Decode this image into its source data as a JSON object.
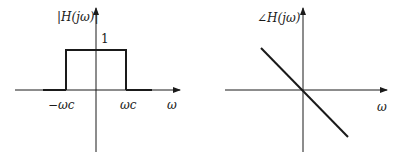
{
  "diagram": {
    "magnitude_plot": {
      "y_label": "|H(jω)|",
      "level_label": "1",
      "x_label": "ω",
      "cutoff_neg_label": "−ωc",
      "cutoff_pos_label": "ωc",
      "description": "Ideal lowpass magnitude: 1 for |ω| < ωc, 0 otherwise"
    },
    "phase_plot": {
      "y_label": "∠H(jω)",
      "x_label": "ω",
      "description": "Linear phase: straight line with negative slope through origin"
    },
    "colors": {
      "ink": "#1a1a1a",
      "background": "#ffffff"
    }
  }
}
